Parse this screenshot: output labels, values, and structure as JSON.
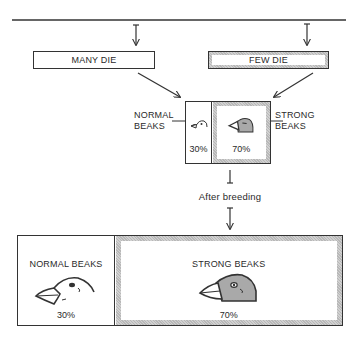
{
  "diagram": {
    "top_branches": [
      {
        "label": "MANY DIE",
        "style": "plain"
      },
      {
        "label": "FEW DIE",
        "style": "shaded"
      }
    ],
    "mid_population": {
      "normal": {
        "label_line1": "NORMAL",
        "label_line2": "BEAKS",
        "percent": "30%"
      },
      "strong": {
        "label_line1": "STRONG",
        "label_line2": "BEAKS",
        "percent": "70%"
      }
    },
    "transition_label": "After breeding",
    "final_population": {
      "normal": {
        "label": "NORMAL BEAKS",
        "percent": "30%"
      },
      "strong": {
        "label": "STRONG BEAKS",
        "percent": "70%"
      }
    },
    "colors": {
      "line": "#333333",
      "shade": "#b8b8b8",
      "strong_head": "#a9a9a9"
    }
  }
}
